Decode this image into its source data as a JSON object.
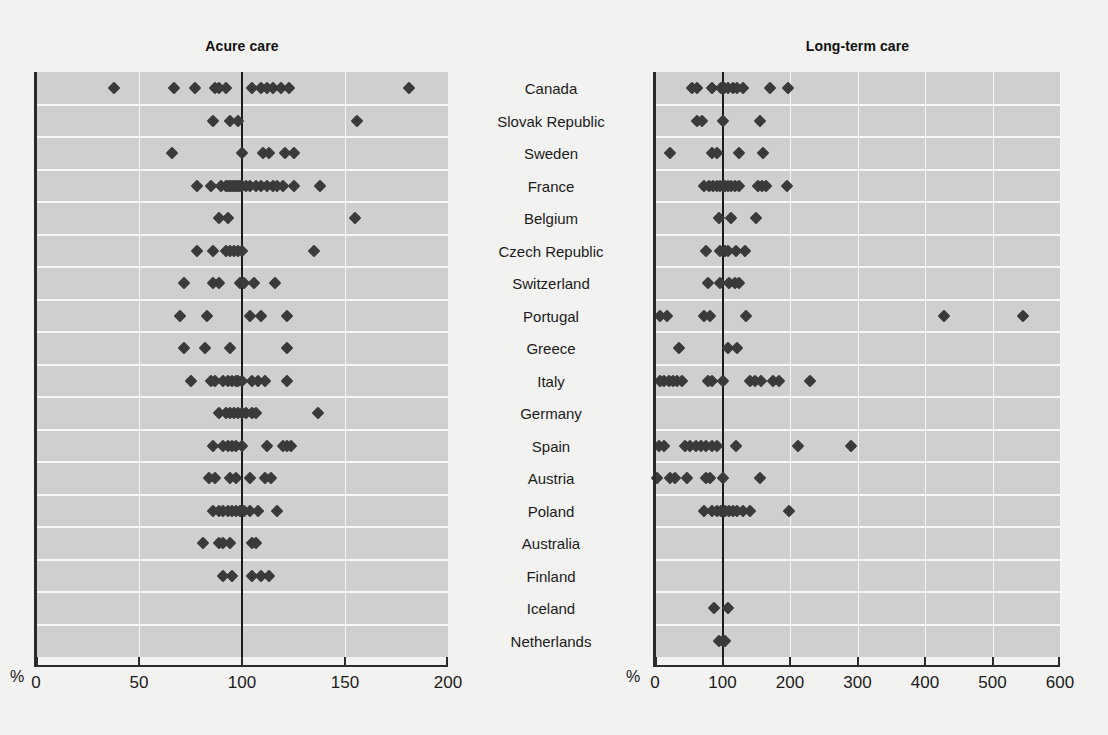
{
  "figure": {
    "background_color": "#f2f2f0",
    "plot_background_color": "#cfcfcf",
    "marker_color": "#3a3a3a",
    "reference_line_color": "#1c1c1c",
    "percent_symbol_left": "%",
    "percent_symbol_right": "%"
  },
  "categories": [
    "Canada",
    "Slovak Republic",
    "Sweden",
    "France",
    "Belgium",
    "Czech Republic",
    "Switzerland",
    "Portugal",
    "Greece",
    "Italy",
    "Germany",
    "Spain",
    "Austria",
    "Poland",
    "Australia",
    "Finland",
    "Iceland",
    "Netherlands"
  ],
  "chart_data": [
    {
      "type": "scatter",
      "title": "Acure care",
      "xlabel": "%",
      "ylabel": "",
      "xlim": [
        0,
        200
      ],
      "xticks": [
        0,
        50,
        100,
        150,
        200
      ],
      "xticklabels": [
        "0",
        "50",
        "100",
        "150",
        "200"
      ],
      "grid": true,
      "reference_line": 100,
      "orientation": "horizontal-dotplot",
      "categories": [
        "Canada",
        "Slovak Republic",
        "Sweden",
        "France",
        "Belgium",
        "Czech Republic",
        "Switzerland",
        "Portugal",
        "Greece",
        "Italy",
        "Germany",
        "Spain",
        "Austria",
        "Poland",
        "Australia",
        "Finland",
        "Iceland",
        "Netherlands"
      ],
      "series": [
        {
          "name": "Canada",
          "values": [
            38,
            67,
            77,
            87,
            89,
            92,
            105,
            109,
            112,
            115,
            119,
            123,
            181
          ]
        },
        {
          "name": "Slovak Republic",
          "values": [
            86,
            94,
            98,
            156
          ]
        },
        {
          "name": "Sweden",
          "values": [
            66,
            100,
            110,
            113,
            121,
            125
          ]
        },
        {
          "name": "France",
          "values": [
            78,
            85,
            90,
            92,
            93,
            94,
            95,
            96,
            97,
            98,
            99,
            100,
            102,
            104,
            107,
            109,
            112,
            115,
            117,
            120,
            125,
            138
          ]
        },
        {
          "name": "Belgium",
          "values": [
            89,
            93,
            155
          ]
        },
        {
          "name": "Czech Republic",
          "values": [
            78,
            86,
            92,
            94,
            96,
            98,
            100,
            135
          ]
        },
        {
          "name": "Switzerland",
          "values": [
            72,
            86,
            89,
            99,
            101,
            106,
            116
          ]
        },
        {
          "name": "Portugal",
          "values": [
            70,
            83,
            104,
            109,
            122
          ]
        },
        {
          "name": "Greece",
          "values": [
            72,
            82,
            94,
            122
          ]
        },
        {
          "name": "Italy",
          "values": [
            75,
            85,
            87,
            91,
            93,
            95,
            97,
            98,
            100,
            105,
            108,
            111,
            122
          ]
        },
        {
          "name": "Germany",
          "values": [
            89,
            92,
            94,
            96,
            98,
            100,
            102,
            105,
            107,
            137
          ]
        },
        {
          "name": "Spain",
          "values": [
            86,
            91,
            93,
            95,
            97,
            100,
            112,
            120,
            122,
            124
          ]
        },
        {
          "name": "Austria",
          "values": [
            84,
            87,
            94,
            97,
            104,
            111,
            114
          ]
        },
        {
          "name": "Poland",
          "values": [
            86,
            89,
            91,
            93,
            95,
            97,
            99,
            101,
            104,
            108,
            117
          ]
        },
        {
          "name": "Australia",
          "values": [
            81,
            89,
            91,
            94,
            105,
            107
          ]
        },
        {
          "name": "Finland",
          "values": [
            91,
            95,
            105,
            109,
            113
          ]
        },
        {
          "name": "Iceland",
          "values": []
        },
        {
          "name": "Netherlands",
          "values": []
        }
      ]
    },
    {
      "type": "scatter",
      "title": "Long-term care",
      "xlabel": "%",
      "ylabel": "",
      "xlim": [
        0,
        600
      ],
      "xticks": [
        0,
        100,
        200,
        300,
        400,
        500,
        600
      ],
      "xticklabels": [
        "0",
        "100",
        "200",
        "300",
        "400",
        "500",
        "600"
      ],
      "grid": true,
      "reference_line": 100,
      "orientation": "horizontal-dotplot",
      "categories": [
        "Canada",
        "Slovak Republic",
        "Sweden",
        "France",
        "Belgium",
        "Czech Republic",
        "Switzerland",
        "Portugal",
        "Greece",
        "Italy",
        "Germany",
        "Spain",
        "Austria",
        "Poland",
        "Australia",
        "Finland",
        "Iceland",
        "Netherlands"
      ],
      "series": [
        {
          "name": "Canada",
          "values": [
            55,
            62,
            85,
            98,
            102,
            108,
            115,
            122,
            130,
            170,
            197
          ]
        },
        {
          "name": "Slovak Republic",
          "values": [
            62,
            70,
            100,
            155
          ]
        },
        {
          "name": "Sweden",
          "values": [
            22,
            85,
            92,
            125,
            160
          ]
        },
        {
          "name": "France",
          "values": [
            72,
            80,
            86,
            92,
            96,
            100,
            104,
            108,
            112,
            118,
            124,
            152,
            158,
            165,
            196
          ]
        },
        {
          "name": "Belgium",
          "values": [
            95,
            112,
            150
          ]
        },
        {
          "name": "Czech Republic",
          "values": [
            75,
            97,
            103,
            108,
            120,
            133
          ]
        },
        {
          "name": "Switzerland",
          "values": [
            78,
            96,
            110,
            118,
            125
          ]
        },
        {
          "name": "Portugal",
          "values": [
            8,
            18,
            72,
            82,
            135,
            428,
            545
          ]
        },
        {
          "name": "Greece",
          "values": [
            35,
            108,
            122
          ]
        },
        {
          "name": "Italy",
          "values": [
            8,
            14,
            20,
            26,
            32,
            40,
            78,
            85,
            100,
            140,
            148,
            157,
            175,
            183,
            230
          ]
        },
        {
          "name": "Germany",
          "values": []
        },
        {
          "name": "Spain",
          "values": [
            6,
            14,
            45,
            52,
            60,
            68,
            76,
            84,
            92,
            120,
            212,
            290
          ]
        },
        {
          "name": "Austria",
          "values": [
            3,
            22,
            30,
            48,
            75,
            82,
            100,
            155
          ]
        },
        {
          "name": "Poland",
          "values": [
            72,
            84,
            92,
            98,
            104,
            110,
            116,
            122,
            130,
            140,
            198
          ]
        },
        {
          "name": "Australia",
          "values": []
        },
        {
          "name": "Finland",
          "values": []
        },
        {
          "name": "Iceland",
          "values": [
            88,
            108
          ]
        },
        {
          "name": "Netherlands",
          "values": [
            95,
            100,
            104
          ]
        }
      ]
    }
  ]
}
